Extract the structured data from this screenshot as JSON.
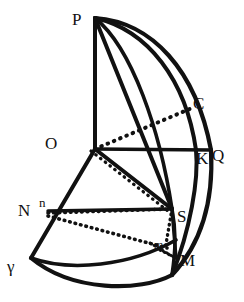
{
  "figure": {
    "stroke_color": "#111111",
    "background_color": "#ffffff",
    "labels": [
      {
        "name": "label-P",
        "text": "P",
        "x": 72,
        "y": 11,
        "size": 17
      },
      {
        "name": "label-C",
        "text": "C",
        "x": 193,
        "y": 95,
        "size": 17
      },
      {
        "name": "label-O",
        "text": "O",
        "x": 45,
        "y": 135,
        "size": 17
      },
      {
        "name": "label-K",
        "text": "K",
        "x": 196,
        "y": 150,
        "size": 17
      },
      {
        "name": "label-Q",
        "text": "Q",
        "x": 212,
        "y": 147,
        "size": 17
      },
      {
        "name": "label-N",
        "text": "N",
        "x": 18,
        "y": 202,
        "size": 17
      },
      {
        "name": "label-n",
        "text": "n",
        "x": 39,
        "y": 196,
        "size": 13
      },
      {
        "name": "label-S",
        "text": "S",
        "x": 177,
        "y": 208,
        "size": 17
      },
      {
        "name": "label-m",
        "text": "m",
        "x": 154,
        "y": 239,
        "size": 12
      },
      {
        "name": "label-M",
        "text": "M",
        "x": 180,
        "y": 252,
        "size": 17
      },
      {
        "name": "label-gamma",
        "text": "γ",
        "x": 7,
        "y": 258,
        "size": 17
      }
    ],
    "points": {
      "P": {
        "x": 95,
        "y": 18
      },
      "C": {
        "x": 192,
        "y": 108
      },
      "O": {
        "x": 95,
        "y": 149
      },
      "K": {
        "x": 197,
        "y": 150
      },
      "Q": {
        "x": 211,
        "y": 150
      },
      "N": {
        "x": 48,
        "y": 211
      },
      "S": {
        "x": 172,
        "y": 209
      },
      "m": {
        "x": 163,
        "y": 246
      },
      "M": {
        "x": 176,
        "y": 258
      },
      "gamma": {
        "x": 31,
        "y": 258
      }
    },
    "solid_lines": [
      {
        "name": "line-P-O",
        "from": "P",
        "to": "O"
      },
      {
        "name": "line-O-Q",
        "from": "O",
        "to": "Q"
      },
      {
        "name": "line-P-S",
        "from": "P",
        "to": "S"
      },
      {
        "name": "line-O-S",
        "from": "O",
        "to": "S"
      },
      {
        "name": "line-O-gamma",
        "from": "O",
        "to": "gamma"
      },
      {
        "name": "line-N-S",
        "from": "N",
        "to": "S"
      },
      {
        "name": "line-S-M",
        "from": "S",
        "to": "M"
      }
    ],
    "dotted_lines": [
      {
        "name": "dotted-O-C",
        "from": "O",
        "to": "C"
      },
      {
        "name": "dotted-O-S",
        "from": "O",
        "to": "S"
      },
      {
        "name": "dotted-N-S",
        "from": "N",
        "to": "S"
      },
      {
        "name": "dotted-N-m",
        "from": "N",
        "to": "m"
      },
      {
        "name": "dotted-S-m",
        "from": "S",
        "to": "m"
      },
      {
        "name": "dotted-m-M",
        "from": "m",
        "to": "M"
      }
    ],
    "arcs": [
      {
        "name": "arc-P-Q-outer",
        "desc": "great circle limb from P through Q"
      },
      {
        "name": "arc-P-S-inner",
        "desc": "meridian from P through C, K area down to S and M"
      },
      {
        "name": "arc-Q-M-lower",
        "desc": "limb continuing from Q down past M"
      },
      {
        "name": "arc-gamma-m",
        "desc": "horizon arc from gamma to m"
      },
      {
        "name": "arc-gamma-M",
        "desc": "outer horizon arc from gamma to M"
      }
    ]
  }
}
